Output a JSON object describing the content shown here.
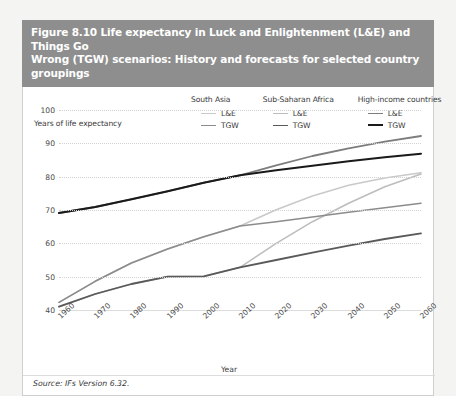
{
  "figure": {
    "title_line1": "Figure 8.10 Life expectancy in Luck and Enlightenment (L&E) and Things Go",
    "title_line2": "Wrong (TGW) scenarios: History and forecasts for selected country groupings",
    "source": "Source: IFs Version 6.32.",
    "title_bar_color": "#8e8e8e",
    "panel_background": "#ffffff"
  },
  "legend": {
    "groups": [
      {
        "heading": "South Asia",
        "entries": [
          {
            "label": "L&E",
            "color": "#c9c9c9",
            "width": 1.6
          },
          {
            "label": "TGW",
            "color": "#8c8c8c",
            "width": 1.6
          }
        ]
      },
      {
        "heading": "Sub-Saharan Africa",
        "entries": [
          {
            "label": "L&E",
            "color": "#bdbdbd",
            "width": 1.6
          },
          {
            "label": "TGW",
            "color": "#5a5a5a",
            "width": 1.8
          }
        ]
      },
      {
        "heading": "High-income countries",
        "entries": [
          {
            "label": "L&E",
            "color": "#7d7d7d",
            "width": 1.8
          },
          {
            "label": "TGW",
            "color": "#1a1a1a",
            "width": 2.0
          }
        ]
      }
    ]
  },
  "chart_data": {
    "type": "line",
    "title": "Figure 8.10 Life expectancy in Luck and Enlightenment (L&E) and Things Go Wrong (TGW) scenarios: History and forecasts for selected country groupings",
    "xlabel": "Year",
    "ylabel": "Years of life expectancy",
    "ylim": [
      40,
      100
    ],
    "yticks": [
      40,
      50,
      60,
      70,
      80,
      90,
      100
    ],
    "xlim": [
      1960,
      2060
    ],
    "xticks": [
      1960,
      1970,
      1980,
      1990,
      2000,
      2010,
      2020,
      2030,
      2040,
      2050,
      2060
    ],
    "grid": true,
    "legend_position": "top",
    "x": [
      1960,
      1970,
      1980,
      1990,
      2000,
      2010,
      2020,
      2030,
      2040,
      2050,
      2060
    ],
    "series": [
      {
        "name": "High-income countries L&E",
        "group": "High-income countries",
        "scenario": "L&E",
        "color": "#7d7d7d",
        "width": 1.8,
        "values": [
          69.1,
          70.9,
          73.2,
          75.6,
          78.2,
          80.4,
          83.4,
          86.2,
          88.5,
          90.5,
          92.2
        ]
      },
      {
        "name": "High-income countries TGW",
        "group": "High-income countries",
        "scenario": "TGW",
        "color": "#1a1a1a",
        "width": 2.0,
        "values": [
          69.1,
          70.9,
          73.2,
          75.6,
          78.2,
          80.4,
          81.9,
          83.3,
          84.6,
          85.8,
          86.9
        ]
      },
      {
        "name": "South Asia L&E",
        "group": "South Asia",
        "scenario": "L&E",
        "color": "#c9c9c9",
        "width": 1.6,
        "values": [
          42.3,
          48.6,
          54.1,
          58.3,
          62.0,
          65.2,
          70.1,
          74.2,
          77.4,
          79.6,
          81.2
        ]
      },
      {
        "name": "South Asia TGW",
        "group": "South Asia",
        "scenario": "TGW",
        "color": "#8c8c8c",
        "width": 1.6,
        "values": [
          42.3,
          48.6,
          54.1,
          58.3,
          62.0,
          65.2,
          66.5,
          67.9,
          69.3,
          70.7,
          72.0
        ]
      },
      {
        "name": "Sub-Saharan Africa L&E",
        "group": "Sub-Saharan Africa",
        "scenario": "L&E",
        "color": "#bdbdbd",
        "width": 1.6,
        "values": [
          41.0,
          44.8,
          47.8,
          50.0,
          50.1,
          52.8,
          60.0,
          66.5,
          72.0,
          77.0,
          80.8
        ]
      },
      {
        "name": "Sub-Saharan Africa TGW",
        "group": "Sub-Saharan Africa",
        "scenario": "TGW",
        "color": "#5a5a5a",
        "width": 1.8,
        "values": [
          41.0,
          44.8,
          47.8,
          50.0,
          50.1,
          52.8,
          55.0,
          57.2,
          59.3,
          61.3,
          63.0
        ]
      }
    ]
  }
}
